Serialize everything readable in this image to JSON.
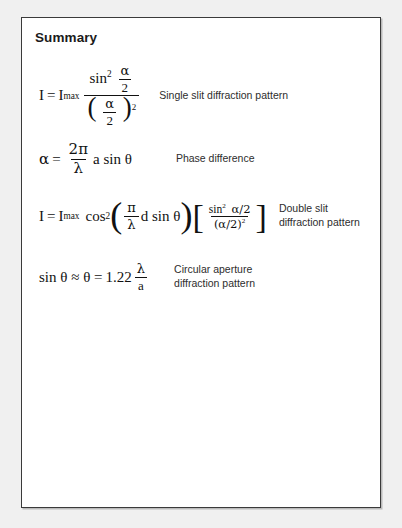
{
  "page": {
    "title": "Summary",
    "background_color": "#f0f0f0",
    "sheet_color": "#ffffff",
    "border_color": "#3a3a3a"
  },
  "formulas": [
    {
      "id": "single-slit",
      "lhs_var": "I",
      "equals": "=",
      "rhs_var": "I",
      "rhs_subscript": "max",
      "numerator_fn": "sin",
      "numerator_exp": "2",
      "numerator_arg_num": "α",
      "numerator_arg_den": "2",
      "denominator_num": "α",
      "denominator_den": "2",
      "denominator_exp": "2",
      "description": "Single slit diffraction pattern"
    },
    {
      "id": "phase-difference",
      "lhs_var": "α",
      "equals": "=",
      "frac_num": "2π",
      "frac_den": "λ",
      "tail": "a sin θ",
      "description": "Phase difference"
    },
    {
      "id": "double-slit",
      "lhs_var": "I",
      "equals": "=",
      "rhs_var": "I",
      "rhs_subscript": "max",
      "fn": "cos",
      "fn_exp": "2",
      "paren_frac_num": "π",
      "paren_frac_den": "λ",
      "paren_tail": "d sin θ",
      "bracket_num": "sin",
      "bracket_num_exp": "2",
      "bracket_num_arg": "α/2",
      "bracket_den": "(α/2)",
      "bracket_den_exp": "2",
      "description": "Double slit\ndiffraction pattern"
    },
    {
      "id": "circular-aperture",
      "lhs": "sin θ ≈ θ =",
      "coefficient": "1.22",
      "frac_num": "λ",
      "frac_den": "a",
      "description": "Circular aperture\ndiffraction pattern"
    }
  ]
}
